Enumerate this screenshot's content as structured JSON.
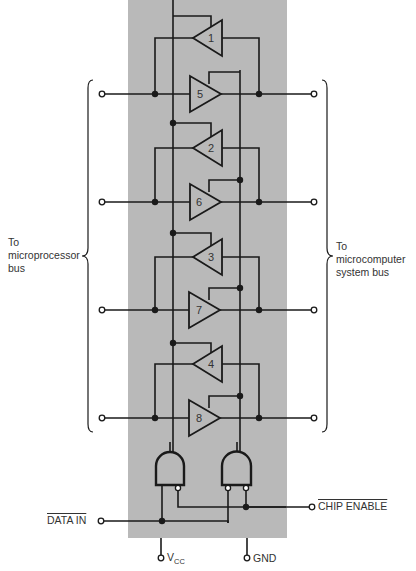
{
  "figure": {
    "background_color": "#ffffff",
    "chip_color": "#b9b9b9",
    "wire_color": "#1a1a1a"
  },
  "labels": {
    "left_bus": [
      "To",
      "microprocessor",
      "bus"
    ],
    "right_bus": [
      "To",
      "microcomputer",
      "system bus"
    ],
    "data_in": "DATA IN",
    "chip_enable": "CHIP ENABLE",
    "vcc_main": "V",
    "vcc_sub": "CC",
    "gnd": "GND"
  },
  "amplifiers": [
    {
      "id": "1",
      "direction": "left",
      "role": "receiver"
    },
    {
      "id": "5",
      "direction": "right",
      "role": "driver"
    },
    {
      "id": "2",
      "direction": "left",
      "role": "receiver"
    },
    {
      "id": "6",
      "direction": "right",
      "role": "driver"
    },
    {
      "id": "3",
      "direction": "left",
      "role": "receiver"
    },
    {
      "id": "7",
      "direction": "right",
      "role": "driver"
    },
    {
      "id": "4",
      "direction": "left",
      "role": "receiver"
    },
    {
      "id": "8",
      "direction": "right",
      "role": "driver"
    }
  ],
  "gates": [
    {
      "name": "left-and-gate",
      "inverted_inputs": 1
    },
    {
      "name": "right-and-gate",
      "inverted_inputs": 2
    }
  ]
}
